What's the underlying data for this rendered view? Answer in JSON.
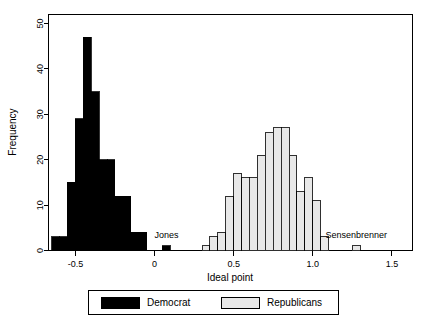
{
  "chart_data": {
    "type": "bar",
    "subtype": "histogram",
    "title": "",
    "xlabel": "Ideal point",
    "ylabel": "Frequency",
    "xlim": [
      -0.67,
      1.63
    ],
    "ylim": [
      0,
      52
    ],
    "xticks": [
      -0.5,
      0,
      0.5,
      1.0,
      1.5
    ],
    "xticklabels": [
      "-0.5",
      "0",
      "0.5",
      "1.0",
      "1.5"
    ],
    "yticks": [
      0,
      10,
      20,
      30,
      40,
      50
    ],
    "yticklabels": [
      "0",
      "10",
      "20",
      "30",
      "40",
      "50"
    ],
    "grid": false,
    "bin_width": 0.05,
    "legend_position": "bottom",
    "series": [
      {
        "name": "Democrat",
        "color": "#000000",
        "edge_color": "#000000",
        "bins": [
          -0.625,
          -0.575,
          -0.525,
          -0.475,
          -0.425,
          -0.375,
          -0.325,
          -0.275,
          -0.225,
          -0.175,
          -0.125,
          -0.075,
          0.075
        ],
        "values": [
          3,
          3,
          15,
          29,
          47,
          35,
          20,
          20,
          12,
          12,
          4,
          4,
          1
        ],
        "annotated_points": [
          {
            "label": "Jones",
            "x": 0.075,
            "y": 1
          }
        ]
      },
      {
        "name": "Republicans",
        "color": "#e8e8e8",
        "edge_color": "#000000",
        "bins": [
          0.325,
          0.375,
          0.425,
          0.475,
          0.525,
          0.575,
          0.625,
          0.675,
          0.725,
          0.775,
          0.825,
          0.875,
          0.925,
          0.975,
          1.025,
          1.075,
          1.275
        ],
        "values": [
          1,
          3,
          4,
          12,
          17,
          16,
          16,
          21,
          26,
          27,
          27,
          21,
          13,
          16,
          11,
          3,
          1
        ],
        "annotated_points": [
          {
            "label": "Sensenbrenner",
            "x": 1.275,
            "y": 1
          }
        ]
      }
    ],
    "annotations": [
      {
        "name": "Jones",
        "text": "Jones",
        "x": 0.075,
        "y": 1
      },
      {
        "name": "Sensenbrenner",
        "text": "Sensenbrenner",
        "x": 1.275,
        "y": 1
      }
    ]
  },
  "legend": {
    "items": [
      {
        "label": "Democrat",
        "swatch_color": "#000000"
      },
      {
        "label": "Republicans",
        "swatch_color": "#e8e8e8"
      }
    ]
  },
  "colors": {
    "democrat": "#000000",
    "republican": "#e8e8e8",
    "axis": "#000000",
    "background": "#ffffff"
  }
}
